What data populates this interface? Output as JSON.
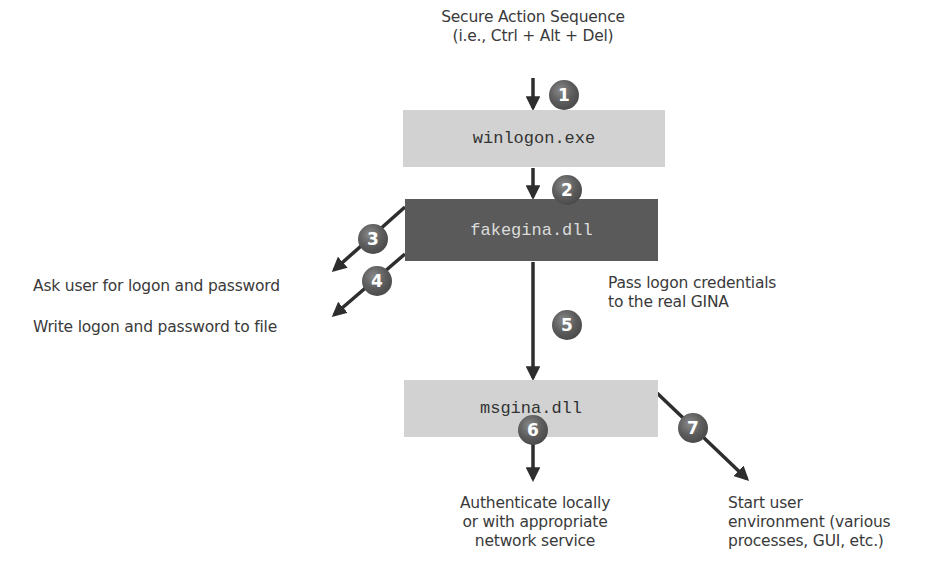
{
  "diagram": {
    "trigger": {
      "line1": "Secure Action Sequence",
      "line2": "(i.e., Ctrl + Alt + Del)"
    },
    "boxes": {
      "winlogon": "winlogon.exe",
      "fakegina": "fakegina.dll",
      "msgina": "msgina.dll"
    },
    "steps": [
      "1",
      "2",
      "3",
      "4",
      "5",
      "6",
      "7"
    ],
    "labels": {
      "ask_user": "Ask user for logon and password",
      "write_file": "Write logon and password to file",
      "pass_creds_line1": "Pass logon credentials",
      "pass_creds_line2": "to the real GINA",
      "authenticate_line1": "Authenticate locally",
      "authenticate_line2": "or with appropriate",
      "authenticate_line3": "network service",
      "start_env_line1": "Start user",
      "start_env_line2": "environment (various",
      "start_env_line3": "processes, GUI, etc.)"
    },
    "colors": {
      "light_box": "#d2d2d2",
      "dark_box": "#5a5a5a",
      "arrow": "#2e2e2e",
      "badge": "#5c5c5c"
    }
  }
}
